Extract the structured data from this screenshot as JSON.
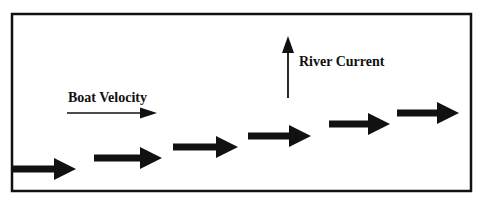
{
  "diagram": {
    "frame": {
      "x1": 12,
      "y1": 14,
      "x2": 471,
      "y2": 191,
      "stroke": "#111111",
      "stroke_width": 2.5
    },
    "legend": {
      "boat_velocity": {
        "label": "Boat Velocity",
        "icon": "thin-right-arrow-icon",
        "arrow": {
          "x1": 67,
          "y1": 113,
          "x2": 157,
          "y2": 113
        }
      },
      "river_current": {
        "label": "River Current",
        "icon": "thin-up-arrow-icon",
        "arrow": {
          "x1": 288,
          "y1": 98,
          "x2": 288,
          "y2": 36
        }
      }
    },
    "boat_path_arrows": [
      {
        "x1": 12,
        "x2": 76,
        "y": 169
      },
      {
        "x1": 94,
        "x2": 162,
        "y": 158
      },
      {
        "x1": 173,
        "x2": 238,
        "y": 147
      },
      {
        "x1": 248,
        "x2": 311,
        "y": 136
      },
      {
        "x1": 329,
        "x2": 390,
        "y": 124
      },
      {
        "x1": 397,
        "x2": 459,
        "y": 113
      }
    ],
    "colors": {
      "ink": "#111111",
      "background": "#ffffff"
    }
  }
}
